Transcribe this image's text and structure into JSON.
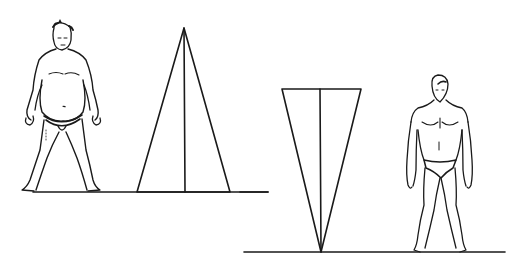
{
  "diagram": {
    "background": "#ffffff",
    "ink_color": "#1a1a1a",
    "panels": [
      {
        "id": "left",
        "figure": "stout-sumo-wrestler",
        "shape": "upright-triangle",
        "ground_y": 192,
        "triangle": {
          "apex": [
            184,
            28
          ],
          "base_left": [
            137,
            192
          ],
          "base_right": [
            230,
            192
          ]
        }
      },
      {
        "id": "right",
        "figure": "athletic-man",
        "shape": "inverted-triangle",
        "ground_y": 252,
        "triangle": {
          "top_left": [
            282,
            89
          ],
          "top_right": [
            361,
            89
          ],
          "apex": [
            321,
            252
          ]
        }
      }
    ]
  }
}
